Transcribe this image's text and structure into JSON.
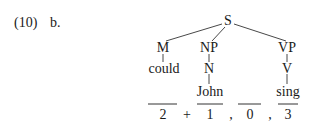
{
  "example": {
    "number": "(10)",
    "sub_label": "b."
  },
  "tree": {
    "root": "S",
    "nodes": {
      "m": "M",
      "np": "NP",
      "vp": "VP",
      "n": "N",
      "v": "V"
    },
    "leaves": {
      "could": "could",
      "john": "John",
      "sing": "sing"
    }
  },
  "numbering": {
    "slots": [
      "2",
      "1",
      "0",
      "3"
    ],
    "separators": [
      "+",
      ",",
      ","
    ]
  }
}
